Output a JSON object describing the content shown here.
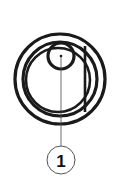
{
  "figure": {
    "background_color": "#ffffff",
    "line_color": "#1a1a1a",
    "leader_line_color": "#4a4a4a",
    "callout_outline_color": "#555555",
    "width": 120,
    "height": 188
  },
  "callouts": [
    {
      "label": "1",
      "name": "callout-1",
      "center_x": 61,
      "center_y": 160,
      "radius": 14
    }
  ],
  "geometry": {
    "outer_ring_outer": {
      "cx": 60,
      "cy": 79,
      "r": 45
    },
    "outer_ring_inner": {
      "cx": 60,
      "cy": 79,
      "r": 37
    },
    "body_circle": {
      "cx": 58,
      "cy": 80,
      "r": 32
    },
    "small_circle": {
      "cx": 61,
      "cy": 56,
      "r": 13
    },
    "center_dot": {
      "cx": 61,
      "cy": 56,
      "r": 1.2
    },
    "right_vertical_line": {
      "x": 85,
      "y1": 46,
      "y2": 112
    },
    "leader_line": {
      "x": 61,
      "y1": 56,
      "y2": 146
    }
  }
}
